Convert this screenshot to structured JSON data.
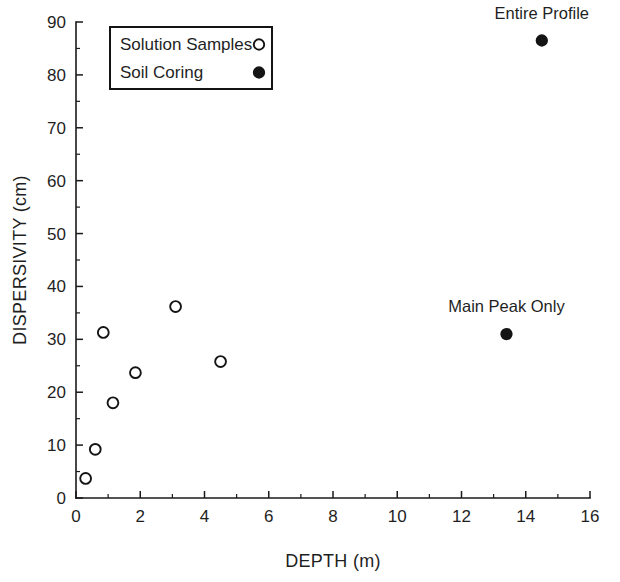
{
  "chart_data": {
    "type": "scatter",
    "title": "",
    "xlabel": "DEPTH (m)",
    "ylabel": "DISPERSIVITY (cm)",
    "xlim": [
      0,
      16
    ],
    "ylim": [
      0,
      90
    ],
    "xticks": [
      0,
      2,
      4,
      6,
      8,
      10,
      12,
      14,
      16
    ],
    "yticks": [
      0,
      10,
      20,
      30,
      40,
      50,
      60,
      70,
      80,
      90
    ],
    "xtick_labels": [
      "0",
      "2",
      "4",
      "6",
      "8",
      "10",
      "12",
      "14",
      "16"
    ],
    "ytick_labels": [
      "0",
      "10",
      "20",
      "30",
      "40",
      "50",
      "60",
      "70",
      "80",
      "90"
    ],
    "x_minor_step": 1,
    "y_minor_step": 5,
    "grid": false,
    "legend_position": "upper-left",
    "series": [
      {
        "name": "Solution Samples",
        "marker": "open-circle",
        "color": "#141414",
        "points": [
          {
            "x": 0.3,
            "y": 3.7
          },
          {
            "x": 0.6,
            "y": 9.2
          },
          {
            "x": 0.85,
            "y": 31.3
          },
          {
            "x": 1.15,
            "y": 18.0
          },
          {
            "x": 1.85,
            "y": 23.7
          },
          {
            "x": 3.1,
            "y": 36.2
          },
          {
            "x": 4.5,
            "y": 25.8
          }
        ]
      },
      {
        "name": "Soil Coring",
        "marker": "filled-circle",
        "color": "#141414",
        "points": [
          {
            "x": 14.5,
            "y": 86.5,
            "label": "Entire Profile"
          },
          {
            "x": 13.4,
            "y": 31.0,
            "label": "Main Peak Only"
          }
        ]
      }
    ],
    "annotations": [
      {
        "text": "Entire Profile",
        "x": 14.5,
        "y": 86.5,
        "dy_px": -22
      },
      {
        "text": "Main Peak Only",
        "x": 13.4,
        "y": 31.0,
        "dy_px": -22
      }
    ]
  },
  "legend": {
    "entries": [
      {
        "label": "Solution Samples",
        "marker": "open-circle"
      },
      {
        "label": "Soil Coring",
        "marker": "filled-circle"
      }
    ]
  }
}
